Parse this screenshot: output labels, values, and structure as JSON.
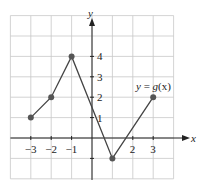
{
  "chart_data": {
    "type": "line",
    "title": "",
    "xlabel": "x",
    "ylabel": "y",
    "annotation": "y = g(x)",
    "x": [
      -3,
      -2,
      -1,
      1,
      3
    ],
    "values": [
      1,
      2,
      4,
      -1,
      2
    ],
    "series": [
      {
        "name": "y = g(x)",
        "x": [
          -3,
          -2,
          -1,
          1,
          3
        ],
        "values": [
          1,
          2,
          4,
          -1,
          2
        ]
      }
    ],
    "xticks": [
      "-3",
      "-2",
      "-1",
      "2",
      "3"
    ],
    "yticks": [
      "1",
      "2",
      "3",
      "4"
    ],
    "xlim": [
      -4,
      4
    ],
    "ylim": [
      -2,
      5
    ],
    "grid": true,
    "legend": "none"
  },
  "labels": {
    "x_axis": "x",
    "y_axis": "y",
    "func_y": "y",
    "func_eq": " = ",
    "func_g": "g",
    "func_arg": "(x)"
  }
}
